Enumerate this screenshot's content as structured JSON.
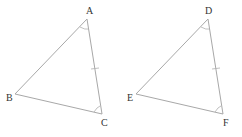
{
  "figure": {
    "triangles": [
      {
        "name": "ABC",
        "vertices": [
          {
            "label": "A",
            "x": 87,
            "y": 19,
            "lx": 86,
            "ly": 14
          },
          {
            "label": "B",
            "x": 15,
            "y": 94,
            "lx": 6,
            "ly": 101
          },
          {
            "label": "C",
            "x": 102,
            "y": 114,
            "lx": 101,
            "ly": 126
          }
        ],
        "tick_side": "AC",
        "angle_marks": [
          "A",
          "C"
        ]
      },
      {
        "name": "DEF",
        "vertices": [
          {
            "label": "D",
            "x": 208,
            "y": 19,
            "lx": 205,
            "ly": 14
          },
          {
            "label": "E",
            "x": 136,
            "y": 94,
            "lx": 127,
            "ly": 101
          },
          {
            "label": "F",
            "x": 223,
            "y": 114,
            "lx": 223,
            "ly": 126
          }
        ],
        "tick_side": "DF",
        "angle_marks": [
          "D",
          "F"
        ]
      }
    ],
    "line_color": "#a8a8a8",
    "label_color": "#333333"
  }
}
